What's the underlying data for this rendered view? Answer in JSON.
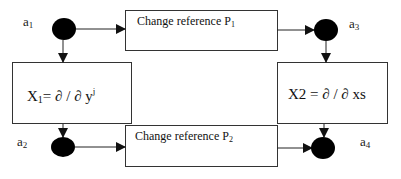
{
  "diagram": {
    "nodes": [
      {
        "id": "a1",
        "label_base": "a",
        "label_sub": "1"
      },
      {
        "id": "a2",
        "label_base": "a",
        "label_sub": "2"
      },
      {
        "id": "a3",
        "label_base": "a",
        "label_sub": "3"
      },
      {
        "id": "a4",
        "label_base": "a",
        "label_sub": "4"
      }
    ],
    "boxes": {
      "top": {
        "text": "Change reference P",
        "sub": "1"
      },
      "bottom": {
        "text": "Change reference P",
        "sub": "2"
      },
      "left": {
        "lhs": "X",
        "lhs_sub": "1",
        "rhs": "= ∂ / ∂ y",
        "rhs_sup": "j"
      },
      "right": {
        "text": "X2 = ∂ / ∂ xs"
      }
    },
    "edges": [
      {
        "from": "a1",
        "to": "box-top"
      },
      {
        "from": "box-top",
        "to": "a3"
      },
      {
        "from": "a1",
        "to": "box-left"
      },
      {
        "from": "box-left",
        "to": "a2"
      },
      {
        "from": "a3",
        "to": "box-right"
      },
      {
        "from": "box-right",
        "to": "a4"
      },
      {
        "from": "a2",
        "to": "box-bottom"
      },
      {
        "from": "box-bottom",
        "to": "a4"
      }
    ],
    "colors": {
      "node": "#000000",
      "line": "#222222",
      "background": "#ffffff"
    }
  }
}
